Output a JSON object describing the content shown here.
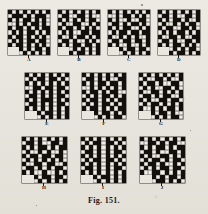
{
  "figure": {
    "caption": "Fig. 151.",
    "background_color": "#e8e6df",
    "ink_color": "#120f0c",
    "cell_color": "#efeee8",
    "grid_size": 11,
    "notch_note": "Each diagram has a 3x2 notch removed from its bottom-left corner.",
    "diagrams": [
      {
        "label": "A",
        "rows": [
          "#.#.#.#.#.#",
          ".###.#.###.",
          "#.#.##.#.#.",
          "..#.#.##.#.",
          "#.##.#.#.##",
          ".#.#.##.#.#",
          "#.##.#.#.#.",
          ".#.#.##.##.",
          "#.##.#.#.#.",
          "xxx#.#.##.#",
          "xxx.#.#.#.#"
        ]
      },
      {
        "label": "B",
        "rows": [
          "#.#.#.#.#.#",
          ".##..##.#..",
          "#.#.#.#.##.",
          ".#..##..#.#",
          "#.##.#.#.#.",
          ".#.#..##.##",
          "#..#.##.#.#",
          ".##.#..#.#.",
          "#.#.##.##.#",
          "xxx.#.#.#.#",
          "xxx#.##.#.#"
        ]
      },
      {
        "label": "C",
        "rows": [
          "#.#.#.#.#.#",
          "..#.##.#.#.",
          "#.#..#..##.",
          ".##.#.##.#.",
          "#.#.##..#.#",
          ".#.##.##.##",
          "#..#.#.#..#",
          ".##.##.##.#",
          "#.#..#..#.#",
          "xxx#.##.##.",
          "xxx.#.#.#.#"
        ]
      },
      {
        "label": "D",
        "rows": [
          "#.#.#.#.#.#",
          ".##.#..##.#",
          "#.#.##.#..#",
          ".#..#.#.##.",
          "#.##..##.#.",
          ".#.#.##.#.#",
          "#..##.#..##",
          ".##.#..##.#",
          "#.#.##.#.#.",
          "xxx.#.#.##.",
          "xxx#.##.#.#"
        ]
      },
      {
        "label": "E",
        "rows": [
          "#.#.#.#.#.#",
          ".#.##.##.#.",
          "#.#.#.#.#.#",
          "..##.##.##.",
          "#.#.#.#.#.#",
          ".##.#.#.##.",
          "#.#.###.#.#",
          ".##.#.#.##.",
          "#.#.#.#.#.#",
          "xxx#.##.#.#",
          "xxx.#.#.#.#"
        ]
      },
      {
        "label": "F",
        "rows": [
          "#.#.#.#.#.#",
          ".##.#.#..##",
          "#.#.##.##.#",
          "..#.#.#.#.#",
          "#.##.#.##..",
          ".#.#.##.#.#",
          "#.##.#.#.##",
          ".#.#.##.#.#",
          "#.##.#.#.##",
          "xxx#.##.#.#",
          "xxx.#.#.##."
        ]
      },
      {
        "label": "G",
        "rows": [
          "#.#.#.#.#.#",
          ".#..##.#..#",
          "#.##.#..##.",
          ".#.#..##.#.",
          "#..##.#.#.#",
          ".##.#.##..#",
          "#.#..##.##.",
          ".#.##.#.#.#",
          "#..#.#.##.#",
          "xxx#.##.#..",
          "xxx.#.#.##."
        ]
      },
      {
        "label": "H",
        "rows": [
          "#.#.#.#.#.#",
          ".##.#..##.#",
          "#.#.##.#.##",
          ".#..#.#..#.",
          "#.##.##.##.",
          ".#.#.#.#.#.",
          "#..##.##..#",
          ".##.#.#.##.",
          "#.#..#..#.#",
          "xxx#.##.##.",
          "xxx.#.#.#.#"
        ]
      },
      {
        "label": "I",
        "rows": [
          "#.#.#.#.#.#",
          ".#.##.##.#.",
          "#.#.#.#.#.#",
          ".##.#.#.##.",
          "#.#.#.#.#.#",
          ".#.##.##.#.",
          "#.#.#.#.#.#",
          ".##.#.#.##.",
          "#.#.#.#.#.#",
          "xxx#.##.#.#",
          "xxx.#.#.#.#"
        ]
      },
      {
        "label": "J",
        "rows": [
          "#.#.#.#.#.#",
          "..##.#.##..",
          "#.#.##.#.##",
          ".##.#..##.#",
          "#.#..##.#.#",
          ".#.##.#.##.",
          "#.##.#..#.#",
          ".#.#.##.##.",
          "#..##.#.#.#",
          "xxx#.#.##.#",
          "xxx.##.#.#."
        ]
      }
    ]
  }
}
